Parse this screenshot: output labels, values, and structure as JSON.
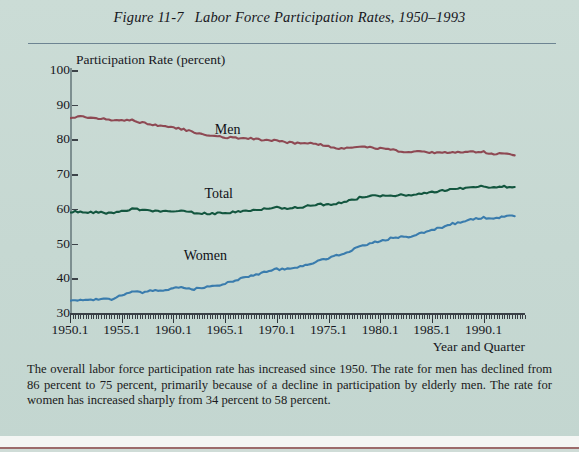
{
  "figure": {
    "number": "Figure 11-7",
    "title": "Labor Force Participation Rates, 1950–1993",
    "caption": "The overall labor force participation rate has increased since 1950. The rate for men has declined from 86 percent to 75 percent, primarily because of a decline in participation by elderly men. The rate for women has increased sharply from 34 percent to 58 percent.",
    "background_color": "#c9dad4",
    "rule_color": "#5d7486"
  },
  "chart_data": {
    "type": "line",
    "title": "Labor Force Participation Rates, 1950–1993",
    "xlabel": "Year and Quarter",
    "ylabel": "Participation Rate (percent)",
    "ylim": [
      30,
      100
    ],
    "ytick_values": [
      30,
      40,
      50,
      60,
      70,
      80,
      90,
      100
    ],
    "ytick_labels": [
      "30",
      "40",
      "50",
      "60",
      "70",
      "80",
      "90",
      "100"
    ],
    "xlim": [
      1950.0,
      1994.0
    ],
    "xtick_values": [
      1950,
      1955,
      1960,
      1965,
      1970,
      1975,
      1980,
      1985,
      1990
    ],
    "xtick_labels": [
      "1950.1",
      "1955.1",
      "1960.1",
      "1965.1",
      "1970.1",
      "1975.1",
      "1980.1",
      "1985.1",
      "1990.1"
    ],
    "x_minor_tick_interval_quarters": 1,
    "grid": false,
    "legend_position": "inline-annotations",
    "series": [
      {
        "name": "Men",
        "color": "#8e4953",
        "label_x": 1964.0,
        "label_y": 82.5,
        "start_value": 86.3,
        "end_value": 75.3,
        "x": [
          1950.0,
          1951.0,
          1952.0,
          1953.0,
          1954.0,
          1955.0,
          1956.0,
          1957.0,
          1958.0,
          1959.0,
          1960.0,
          1961.0,
          1962.0,
          1963.0,
          1964.0,
          1965.0,
          1966.0,
          1967.0,
          1968.0,
          1969.0,
          1970.0,
          1971.0,
          1972.0,
          1973.0,
          1974.0,
          1975.0,
          1976.0,
          1977.0,
          1978.0,
          1979.0,
          1980.0,
          1981.0,
          1982.0,
          1983.0,
          1984.0,
          1985.0,
          1986.0,
          1987.0,
          1988.0,
          1989.0,
          1990.0,
          1991.0,
          1992.0,
          1993.0
        ],
        "values": [
          86.4,
          86.5,
          86.3,
          86.0,
          85.5,
          85.4,
          85.5,
          84.8,
          84.2,
          83.7,
          83.3,
          82.9,
          82.0,
          81.4,
          81.0,
          80.7,
          80.4,
          80.4,
          80.1,
          79.8,
          79.7,
          79.1,
          78.9,
          78.8,
          78.7,
          77.9,
          77.5,
          77.7,
          77.9,
          77.8,
          77.4,
          77.0,
          76.6,
          76.4,
          76.4,
          76.3,
          76.3,
          76.2,
          76.2,
          76.4,
          76.4,
          75.8,
          75.8,
          75.4
        ]
      },
      {
        "name": "Total",
        "color": "#13563f",
        "label_x": 1963.0,
        "label_y": 64.0,
        "start_value": 59.2,
        "end_value": 66.2,
        "x": [
          1950.0,
          1951.0,
          1952.0,
          1953.0,
          1954.0,
          1955.0,
          1956.0,
          1957.0,
          1958.0,
          1959.0,
          1960.0,
          1961.0,
          1962.0,
          1963.0,
          1964.0,
          1965.0,
          1966.0,
          1967.0,
          1968.0,
          1969.0,
          1970.0,
          1971.0,
          1972.0,
          1973.0,
          1974.0,
          1975.0,
          1976.0,
          1977.0,
          1978.0,
          1979.0,
          1980.0,
          1981.0,
          1982.0,
          1983.0,
          1984.0,
          1985.0,
          1986.0,
          1987.0,
          1988.0,
          1989.0,
          1990.0,
          1991.0,
          1992.0,
          1993.0
        ],
        "values": [
          59.2,
          59.2,
          59.0,
          58.9,
          58.8,
          59.3,
          60.0,
          59.6,
          59.5,
          59.3,
          59.4,
          59.3,
          58.8,
          58.7,
          58.7,
          58.9,
          59.2,
          59.6,
          59.6,
          60.1,
          60.4,
          60.2,
          60.4,
          60.8,
          61.3,
          61.2,
          61.6,
          62.3,
          63.2,
          63.7,
          63.8,
          63.9,
          64.0,
          64.0,
          64.4,
          64.8,
          65.3,
          65.6,
          65.9,
          66.5,
          66.5,
          66.2,
          66.4,
          66.3
        ]
      },
      {
        "name": "Women",
        "color": "#3a7cad",
        "label_x": 1961.0,
        "label_y": 46.0,
        "start_value": 33.9,
        "end_value": 57.9,
        "x": [
          1950.0,
          1951.0,
          1952.0,
          1953.0,
          1954.0,
          1955.0,
          1956.0,
          1957.0,
          1958.0,
          1959.0,
          1960.0,
          1961.0,
          1962.0,
          1963.0,
          1964.0,
          1965.0,
          1966.0,
          1967.0,
          1968.0,
          1969.0,
          1970.0,
          1971.0,
          1972.0,
          1973.0,
          1974.0,
          1975.0,
          1976.0,
          1977.0,
          1978.0,
          1979.0,
          1980.0,
          1981.0,
          1982.0,
          1983.0,
          1984.0,
          1985.0,
          1986.0,
          1987.0,
          1988.0,
          1989.0,
          1990.0,
          1991.0,
          1992.0,
          1993.0
        ],
        "values": [
          33.3,
          33.7,
          33.9,
          33.9,
          34.0,
          35.0,
          36.0,
          36.0,
          36.4,
          36.6,
          37.1,
          37.4,
          36.9,
          37.4,
          37.7,
          38.5,
          39.5,
          40.4,
          41.1,
          41.9,
          42.6,
          42.7,
          43.3,
          44.0,
          44.9,
          45.9,
          46.8,
          47.7,
          49.1,
          50.0,
          50.7,
          51.5,
          51.9,
          52.1,
          53.1,
          54.0,
          54.7,
          55.7,
          56.2,
          57.0,
          57.5,
          57.3,
          57.8,
          57.9
        ]
      }
    ]
  }
}
